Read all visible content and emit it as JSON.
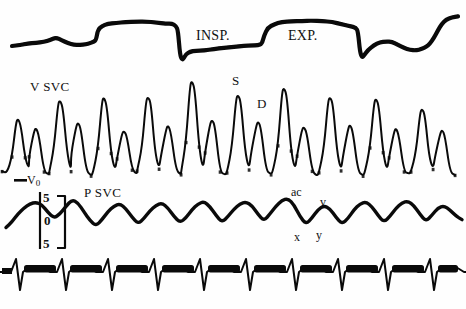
{
  "figure": {
    "background_color": "#fefefe",
    "ink_color": "#0a0a0a",
    "width": 466,
    "height": 309
  },
  "labels": {
    "inspiration": "INSP.",
    "expiration": "EXP.",
    "velocity_channel": "V SVC",
    "pressure_channel": "P SVC",
    "systolic_peak": "S",
    "diastolic_peak": "D",
    "zero_velocity": "V",
    "zero_velocity_sub": "0",
    "ac_wave": "ac",
    "v_wave": "v",
    "x_descent": "x",
    "y_descent": "y",
    "cal_upper": "5",
    "cal_zero": "0",
    "cal_lower": "5"
  },
  "chart_data": {
    "type": "line",
    "xlabel": "",
    "ylabel": "",
    "grid": false,
    "legend": "none",
    "panels": [
      {
        "name": "respiration",
        "label": "",
        "annotations": [
          "INSP.",
          "EXP."
        ],
        "ylim": [
          0,
          1
        ],
        "points": [
          [
            12,
            46
          ],
          [
            20,
            45
          ],
          [
            28,
            44
          ],
          [
            36,
            43
          ],
          [
            44,
            42
          ],
          [
            50,
            40
          ],
          [
            56,
            38
          ],
          [
            62,
            40
          ],
          [
            68,
            43
          ],
          [
            74,
            45
          ],
          [
            80,
            45
          ],
          [
            86,
            44
          ],
          [
            90,
            43
          ],
          [
            94,
            42
          ],
          [
            96,
            40
          ],
          [
            98,
            30
          ],
          [
            102,
            26
          ],
          [
            108,
            24
          ],
          [
            116,
            23
          ],
          [
            126,
            22
          ],
          [
            136,
            22
          ],
          [
            146,
            22
          ],
          [
            156,
            22
          ],
          [
            166,
            23
          ],
          [
            172,
            24
          ],
          [
            176,
            26
          ],
          [
            178,
            30
          ],
          [
            180,
            55
          ],
          [
            182,
            60
          ],
          [
            184,
            58
          ],
          [
            186,
            54
          ],
          [
            190,
            52
          ],
          [
            196,
            51
          ],
          [
            204,
            50
          ],
          [
            214,
            49
          ],
          [
            224,
            48
          ],
          [
            234,
            47
          ],
          [
            244,
            46
          ],
          [
            252,
            46
          ],
          [
            258,
            45
          ],
          [
            262,
            44
          ],
          [
            264,
            36
          ],
          [
            268,
            28
          ],
          [
            274,
            24
          ],
          [
            282,
            22
          ],
          [
            292,
            21
          ],
          [
            302,
            21
          ],
          [
            312,
            21
          ],
          [
            322,
            21
          ],
          [
            332,
            22
          ],
          [
            342,
            24
          ],
          [
            350,
            26
          ],
          [
            356,
            28
          ],
          [
            358,
            32
          ],
          [
            360,
            52
          ],
          [
            362,
            58
          ],
          [
            364,
            56
          ],
          [
            368,
            50
          ],
          [
            374,
            45
          ],
          [
            380,
            42
          ],
          [
            386,
            41
          ],
          [
            392,
            42
          ],
          [
            398,
            45
          ],
          [
            404,
            48
          ],
          [
            410,
            50
          ],
          [
            416,
            50
          ],
          [
            422,
            49
          ],
          [
            426,
            47
          ],
          [
            430,
            44
          ],
          [
            434,
            38
          ],
          [
            438,
            30
          ],
          [
            442,
            24
          ],
          [
            446,
            20
          ],
          [
            452,
            17
          ],
          [
            458,
            16
          ]
        ]
      },
      {
        "name": "svc_velocity",
        "label": "V SVC",
        "annotations": [
          "S",
          "D",
          "V0"
        ],
        "baseline_y": 176,
        "ylim": [
          0,
          1
        ],
        "beats": [
          {
            "s_peak_x": 18,
            "s_peak_y": 118,
            "d_peak_x": 36,
            "d_peak_y": 128
          },
          {
            "s_peak_x": 60,
            "s_peak_y": 100,
            "d_peak_x": 78,
            "d_peak_y": 122
          },
          {
            "s_peak_x": 104,
            "s_peak_y": 98,
            "d_peak_x": 124,
            "d_peak_y": 130
          },
          {
            "s_peak_x": 148,
            "s_peak_y": 96,
            "d_peak_x": 168,
            "d_peak_y": 126
          },
          {
            "s_peak_x": 192,
            "s_peak_y": 82,
            "d_peak_x": 212,
            "d_peak_y": 120
          },
          {
            "s_peak_x": 238,
            "s_peak_y": 94,
            "d_peak_x": 258,
            "d_peak_y": 122
          },
          {
            "s_peak_x": 284,
            "s_peak_y": 88,
            "d_peak_x": 304,
            "d_peak_y": 126
          },
          {
            "s_peak_x": 330,
            "s_peak_y": 96,
            "d_peak_x": 350,
            "d_peak_y": 124
          },
          {
            "s_peak_x": 376,
            "s_peak_y": 98,
            "d_peak_x": 396,
            "d_peak_y": 128
          },
          {
            "s_peak_x": 422,
            "s_peak_y": 108,
            "d_peak_x": 442,
            "d_peak_y": 130
          }
        ]
      },
      {
        "name": "svc_pressure",
        "label": "P SVC",
        "annotations": [
          "ac",
          "x",
          "v",
          "y"
        ],
        "scale_unit_marks": [
          "5",
          "0",
          "5"
        ],
        "ylim": [
          0,
          1
        ],
        "points": [
          [
            6,
            228
          ],
          [
            12,
            222
          ],
          [
            18,
            214
          ],
          [
            24,
            208
          ],
          [
            30,
            204
          ],
          [
            36,
            202
          ],
          [
            42,
            205
          ],
          [
            48,
            212
          ],
          [
            54,
            218
          ],
          [
            60,
            214
          ],
          [
            66,
            206
          ],
          [
            72,
            200
          ],
          [
            78,
            203
          ],
          [
            84,
            212
          ],
          [
            90,
            220
          ],
          [
            96,
            226
          ],
          [
            102,
            220
          ],
          [
            108,
            212
          ],
          [
            114,
            206
          ],
          [
            120,
            204
          ],
          [
            126,
            209
          ],
          [
            132,
            217
          ],
          [
            138,
            224
          ],
          [
            144,
            219
          ],
          [
            150,
            211
          ],
          [
            156,
            205
          ],
          [
            162,
            203
          ],
          [
            168,
            208
          ],
          [
            174,
            216
          ],
          [
            180,
            223
          ],
          [
            186,
            218
          ],
          [
            192,
            210
          ],
          [
            198,
            204
          ],
          [
            204,
            202
          ],
          [
            210,
            207
          ],
          [
            216,
            215
          ],
          [
            222,
            222
          ],
          [
            228,
            217
          ],
          [
            234,
            209
          ],
          [
            240,
            204
          ],
          [
            246,
            202
          ],
          [
            252,
            206
          ],
          [
            258,
            214
          ],
          [
            264,
            221
          ],
          [
            270,
            214
          ],
          [
            276,
            206
          ],
          [
            282,
            200
          ],
          [
            288,
            198
          ],
          [
            294,
            205
          ],
          [
            300,
            216
          ],
          [
            306,
            224
          ],
          [
            312,
            218
          ],
          [
            318,
            210
          ],
          [
            324,
            206
          ],
          [
            330,
            209
          ],
          [
            336,
            217
          ],
          [
            342,
            224
          ],
          [
            348,
            218
          ],
          [
            354,
            210
          ],
          [
            360,
            204
          ],
          [
            366,
            202
          ],
          [
            372,
            207
          ],
          [
            378,
            215
          ],
          [
            384,
            222
          ],
          [
            390,
            216
          ],
          [
            396,
            208
          ],
          [
            402,
            203
          ],
          [
            408,
            201
          ],
          [
            414,
            206
          ],
          [
            420,
            214
          ],
          [
            426,
            221
          ],
          [
            432,
            215
          ],
          [
            438,
            208
          ],
          [
            444,
            206
          ],
          [
            450,
            210
          ],
          [
            456,
            216
          ],
          [
            462,
            220
          ]
        ]
      },
      {
        "name": "ecg",
        "label": "",
        "annotations": [],
        "ylim": [
          0,
          1
        ],
        "r_wave_positions": [
          18,
          64,
          110,
          156,
          202,
          248,
          294,
          340,
          386,
          432
        ]
      }
    ]
  }
}
